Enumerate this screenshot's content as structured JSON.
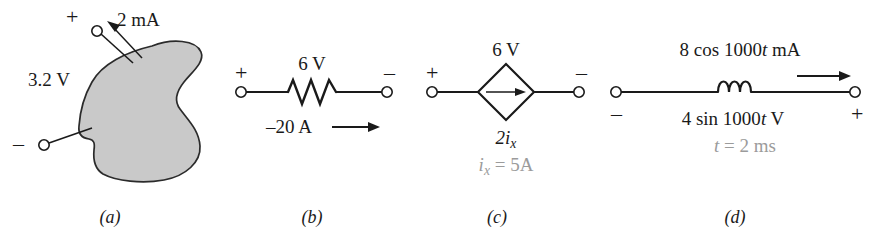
{
  "figure": {
    "type": "circuit-element-diagram",
    "panels": [
      {
        "id": "a",
        "caption": "(a)",
        "element": "generic-black-box",
        "labels": {
          "plus": "+",
          "minus": "–",
          "current": "2 mA",
          "voltage": "3.2 V"
        }
      },
      {
        "id": "b",
        "caption": "(b)",
        "element": "resistor",
        "labels": {
          "plus": "+",
          "minus": "–",
          "voltage": "6 V",
          "current": "–20 A"
        }
      },
      {
        "id": "c",
        "caption": "(c)",
        "element": "dependent-current-source",
        "labels": {
          "plus": "+",
          "minus": "–",
          "voltage": "6 V",
          "source_value_main": "2i",
          "source_value_sub": "x",
          "annotation_main": "i",
          "annotation_sub": "x",
          "annotation_rest": "= 5A"
        }
      },
      {
        "id": "d",
        "caption": "(d)",
        "element": "inductor",
        "labels": {
          "minus": "–",
          "plus": "+",
          "current_pre": "8 cos 1000",
          "current_var": "t",
          "current_post": " mA",
          "voltage_pre": "4 sin 1000",
          "voltage_var": "t",
          "voltage_post": " V",
          "annotation_var": "t",
          "annotation_rest": "= 2 ms"
        }
      }
    ],
    "colors": {
      "ink": "#1a1a1a",
      "blob_fill": "#c9c9c9",
      "blob_stroke": "#2b2b2b",
      "annotation_gray": "#9b9b9b",
      "background": "#ffffff"
    }
  }
}
